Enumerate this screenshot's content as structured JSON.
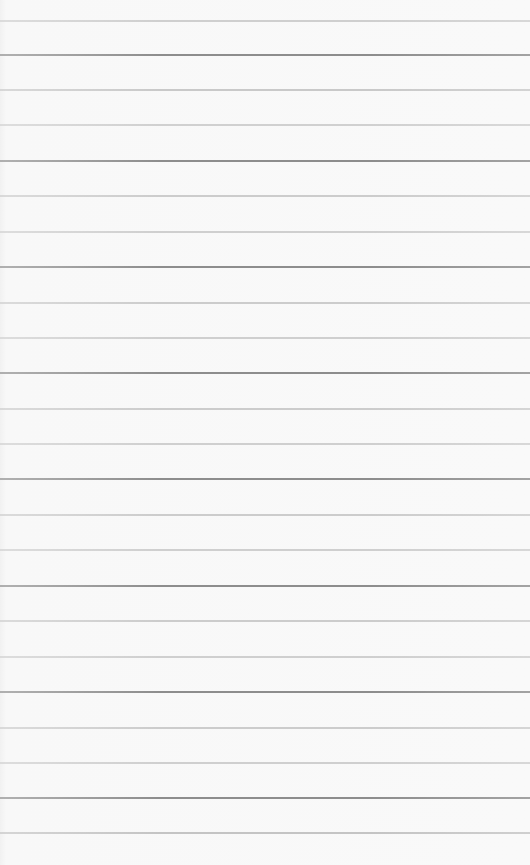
{
  "paper": {
    "background": "#f8f8f8",
    "rules": [
      {
        "y": 20,
        "color": "#cfcfcf"
      },
      {
        "y": 54,
        "color": "#8d8d8d"
      },
      {
        "y": 89,
        "color": "#c9c9c9"
      },
      {
        "y": 124,
        "color": "#d0d0d0"
      },
      {
        "y": 160,
        "color": "#8d8d8d"
      },
      {
        "y": 195,
        "color": "#cccccc"
      },
      {
        "y": 231,
        "color": "#cfcfcf"
      },
      {
        "y": 266,
        "color": "#8d8d8d"
      },
      {
        "y": 302,
        "color": "#cccccc"
      },
      {
        "y": 337,
        "color": "#cfcfcf"
      },
      {
        "y": 372,
        "color": "#8d8d8d"
      },
      {
        "y": 408,
        "color": "#cccccc"
      },
      {
        "y": 443,
        "color": "#cfcfcf"
      },
      {
        "y": 478,
        "color": "#8d8d8d"
      },
      {
        "y": 514,
        "color": "#cccccc"
      },
      {
        "y": 549,
        "color": "#cfcfcf"
      },
      {
        "y": 585,
        "color": "#8d8d8d"
      },
      {
        "y": 620,
        "color": "#cccccc"
      },
      {
        "y": 656,
        "color": "#cfcfcf"
      },
      {
        "y": 691,
        "color": "#8d8d8d"
      },
      {
        "y": 727,
        "color": "#cccccc"
      },
      {
        "y": 762,
        "color": "#cfcfcf"
      },
      {
        "y": 797,
        "color": "#8d8d8d"
      },
      {
        "y": 832,
        "color": "#c4c4c4"
      }
    ]
  }
}
